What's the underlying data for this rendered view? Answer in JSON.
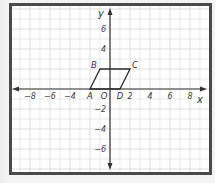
{
  "figure": {
    "type": "coordinate-plane",
    "axes": {
      "x_label": "x",
      "y_label": "y",
      "origin_label": "O",
      "x_ticks": [
        {
          "value": -8,
          "label": "−8"
        },
        {
          "value": -6,
          "label": "−6"
        },
        {
          "value": -4,
          "label": "−4"
        },
        {
          "value": 2,
          "label": "2"
        },
        {
          "value": 4,
          "label": "4"
        },
        {
          "value": 6,
          "label": "6"
        },
        {
          "value": 8,
          "label": "8"
        }
      ],
      "y_ticks": [
        {
          "value": 6,
          "label": "6"
        },
        {
          "value": 4,
          "label": "4"
        },
        {
          "value": -2,
          "label": "−2"
        },
        {
          "value": -4,
          "label": "−4"
        },
        {
          "value": -6,
          "label": "−6"
        }
      ],
      "x_range": [
        -9,
        9
      ],
      "y_range": [
        -8,
        8
      ],
      "grid": true,
      "grid_step": 1
    },
    "shape": {
      "name": "parallelogram ABCD",
      "vertices": [
        {
          "label": "A",
          "x": -2,
          "y": 0
        },
        {
          "label": "B",
          "x": -1,
          "y": 2
        },
        {
          "label": "C",
          "x": 2,
          "y": 2
        },
        {
          "label": "D",
          "x": 1,
          "y": 0
        }
      ]
    },
    "colors": {
      "frame": "#4a4a4a",
      "grid": "#d9d9d9",
      "axis": "#333333",
      "shape": "#2b2b2b"
    }
  }
}
